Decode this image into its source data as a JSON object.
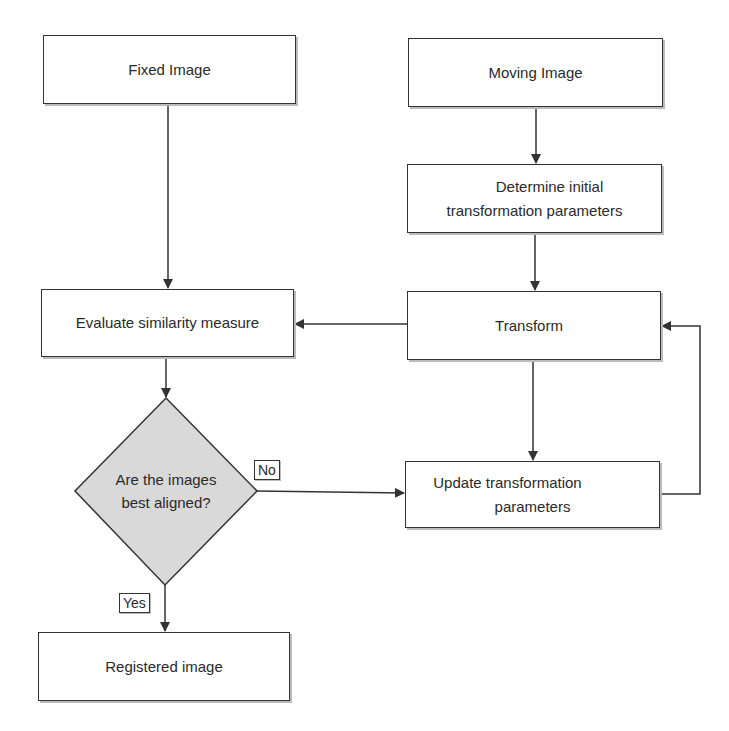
{
  "nodes": {
    "fixed_image": "Fixed Image",
    "moving_image": "Moving Image",
    "determine_params_line1": "Determine initial",
    "determine_params_line2": "transformation parameters",
    "evaluate_similarity": "Evaluate similarity measure",
    "transform": "Transform",
    "decision_line1": "Are the images",
    "decision_line2": "best aligned?",
    "update_params_line1": "Update transformation",
    "update_params_line2": "parameters",
    "registered_image": "Registered image"
  },
  "edge_labels": {
    "no": "No",
    "yes": "Yes"
  },
  "colors": {
    "stroke": "#333333",
    "diamond_fill": "#d9d9d9",
    "box_fill": "#ffffff"
  }
}
